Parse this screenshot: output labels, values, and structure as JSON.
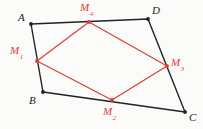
{
  "figure": {
    "kind": "geometry-diagram",
    "background_color": "#fbfbf9",
    "outer_color": "#222222",
    "inner_color": "#e03a3a",
    "width": 203,
    "height": 129,
    "outer_polygon": {
      "name": "ABCD",
      "stroke": "#222222",
      "stroke_width": 1.4,
      "vertices": [
        {
          "id": "A",
          "label": "A",
          "x": 31,
          "y": 24,
          "label_x": 18,
          "label_y": 12
        },
        {
          "id": "D",
          "label": "D",
          "x": 148,
          "y": 19,
          "label_x": 152,
          "label_y": 5
        },
        {
          "id": "C",
          "label": "C",
          "x": 185,
          "y": 112,
          "label_x": 189,
          "label_y": 112
        },
        {
          "id": "B",
          "label": "B",
          "x": 43,
          "y": 92,
          "label_x": 29,
          "label_y": 95
        }
      ]
    },
    "inner_polygon": {
      "name": "M1M2M3M4",
      "stroke": "#e03a3a",
      "stroke_width": 1.2,
      "vertices": [
        {
          "id": "M1",
          "label": "M",
          "subscript": "1",
          "x": 37,
          "y": 61,
          "label_x": 10,
          "label_y": 45
        },
        {
          "id": "M2",
          "label": "M",
          "subscript": "2",
          "x": 112,
          "y": 100,
          "label_x": 103,
          "label_y": 106
        },
        {
          "id": "M3",
          "label": "M",
          "subscript": "3",
          "x": 167,
          "y": 66,
          "label_x": 171,
          "label_y": 57
        },
        {
          "id": "M4",
          "label": "M",
          "subscript": "4",
          "x": 89,
          "y": 22,
          "label_x": 80,
          "label_y": 2
        }
      ]
    },
    "point_markers": {
      "outer_radius": 1.9,
      "inner_radius": 1.9
    }
  }
}
